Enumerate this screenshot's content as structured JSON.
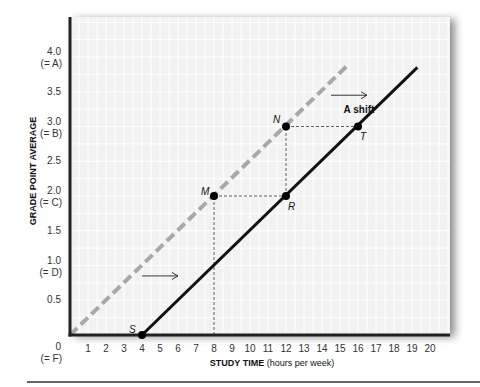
{
  "chart_data": {
    "type": "line",
    "title": "",
    "xlabel": "STUDY TIME",
    "xlabel_suffix": "(hours per week)",
    "ylabel": "GRADE POINT AVERAGE",
    "xlim": [
      0,
      20
    ],
    "ylim": [
      0,
      4.3
    ],
    "grid": true,
    "x_ticks": [
      "1",
      "2",
      "3",
      "4",
      "5",
      "6",
      "7",
      "8",
      "9",
      "10",
      "11",
      "12",
      "13",
      "14",
      "15",
      "16",
      "17",
      "18",
      "19",
      "20"
    ],
    "y_ticks": [
      {
        "value": 0,
        "label": "0",
        "sub": "(= F)"
      },
      {
        "value": 0.5,
        "label": "0.5",
        "sub": ""
      },
      {
        "value": 1.0,
        "label": "1.0",
        "sub": "(= D)"
      },
      {
        "value": 1.5,
        "label": "1.5",
        "sub": ""
      },
      {
        "value": 2.0,
        "label": "2.0",
        "sub": "(= C)"
      },
      {
        "value": 2.5,
        "label": "2.5",
        "sub": ""
      },
      {
        "value": 3.0,
        "label": "3.0",
        "sub": "(= B)"
      },
      {
        "value": 3.5,
        "label": "3.5",
        "sub": ""
      },
      {
        "value": 4.0,
        "label": "4.0",
        "sub": "(= A)"
      }
    ],
    "series": [
      {
        "name": "Original relationship (dashed)",
        "style": "dashed",
        "color": "#a8a8a8",
        "x": [
          0,
          15.5
        ],
        "y": [
          0,
          3.9
        ]
      },
      {
        "name": "Shifted relationship (solid)",
        "style": "solid",
        "color": "#111111",
        "x": [
          4,
          19.3
        ],
        "y": [
          0,
          3.85
        ]
      }
    ],
    "points": [
      {
        "label": "S",
        "x": 4,
        "y": 0
      },
      {
        "label": "M",
        "x": 8,
        "y": 2
      },
      {
        "label": "N",
        "x": 12,
        "y": 3
      },
      {
        "label": "R",
        "x": 12,
        "y": 2
      },
      {
        "label": "T",
        "x": 16,
        "y": 3
      }
    ],
    "annotations": [
      {
        "text": "A shift",
        "x": 15.2,
        "y": 3.2
      },
      {
        "text": "→",
        "type": "arrow",
        "from": [
          14.5,
          3.45
        ],
        "to": [
          16.5,
          3.45
        ]
      },
      {
        "text": "→",
        "type": "arrow",
        "from": [
          4,
          0.85
        ],
        "to": [
          6,
          0.85
        ]
      }
    ],
    "legend": "none"
  }
}
